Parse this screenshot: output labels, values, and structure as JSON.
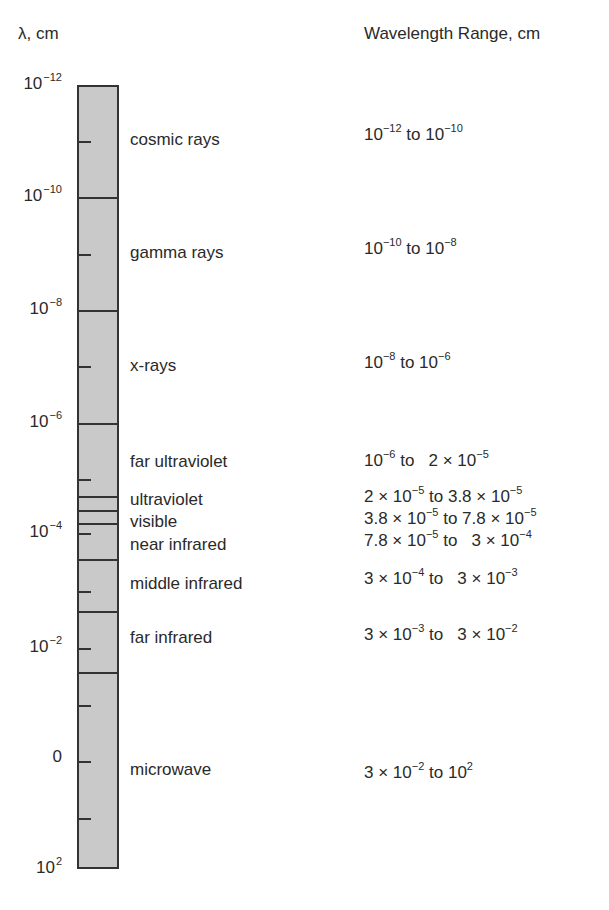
{
  "header": {
    "axis_title": "λ, cm",
    "range_title": "Wavelength Range, cm"
  },
  "axis": {
    "labels": [
      {
        "base": "10",
        "exp": "−12",
        "y": 85
      },
      {
        "base": "10",
        "exp": "−10",
        "y": 197
      },
      {
        "base": "10",
        "exp": "−8",
        "y": 310
      },
      {
        "base": "10",
        "exp": "−6",
        "y": 423
      },
      {
        "base": "10",
        "exp": "−4",
        "y": 533
      },
      {
        "base": "10",
        "exp": "−2",
        "y": 648
      },
      {
        "base": "0",
        "exp": "",
        "y": 761
      },
      {
        "base": "10",
        "exp": "2",
        "y": 869
      }
    ]
  },
  "bands": [
    {
      "name": "cosmic rays",
      "range_a": "10",
      "range_a_exp": "−12",
      "range_mid": " to 10",
      "range_b_exp": "−10",
      "label_y": 130,
      "range_y": 122
    },
    {
      "name": "gamma rays",
      "range_a": "10",
      "range_a_exp": "−10",
      "range_mid": " to 10",
      "range_b_exp": "−8",
      "label_y": 243,
      "range_y": 236
    },
    {
      "name": "x-rays",
      "range_a": "10",
      "range_a_exp": "−8",
      "range_mid": " to 10",
      "range_b_exp": "−6",
      "label_y": 356,
      "range_y": 350
    },
    {
      "name": "far ultraviolet",
      "range_a": "10",
      "range_a_exp": "−6",
      "range_mid": " to   2 × 10",
      "range_b_exp": "−5",
      "label_y": 452,
      "range_y": 448
    },
    {
      "name": "ultraviolet",
      "range_a": "2 × 10",
      "range_a_exp": "−5",
      "range_mid": " to 3.8 × 10",
      "range_b_exp": "−5",
      "label_y": 490,
      "range_y": 484
    },
    {
      "name": "visible",
      "range_a": "3.8 × 10",
      "range_a_exp": "−5",
      "range_mid": " to 7.8 × 10",
      "range_b_exp": "−5",
      "label_y": 512,
      "range_y": 506
    },
    {
      "name": "near infrared",
      "range_a": "7.8 × 10",
      "range_a_exp": "−5",
      "range_mid": " to   3 × 10",
      "range_b_exp": "−4",
      "label_y": 535,
      "range_y": 528
    },
    {
      "name": "middle infrared",
      "range_a": "3 × 10",
      "range_a_exp": "−4",
      "range_mid": " to   3 × 10",
      "range_b_exp": "−3",
      "label_y": 574,
      "range_y": 566
    },
    {
      "name": "far infrared",
      "range_a": "3 × 10",
      "range_a_exp": "−3",
      "range_mid": " to   3 × 10",
      "range_b_exp": "−2",
      "label_y": 628,
      "range_y": 622
    },
    {
      "name": "microwave",
      "range_a": "3 × 10",
      "range_a_exp": "−2",
      "range_mid": " to 10",
      "range_b_exp": "2",
      "label_y": 760,
      "range_y": 760
    }
  ],
  "dividers_y": [
    197,
    310,
    423,
    496,
    510,
    523,
    559,
    611,
    672
  ],
  "ticks_y": [
    141,
    254,
    366,
    479,
    533,
    591,
    648,
    705,
    761,
    818
  ],
  "colors": {
    "bar_fill": "#c9c9c9",
    "line": "#333333",
    "text": "#2a2a2a"
  }
}
